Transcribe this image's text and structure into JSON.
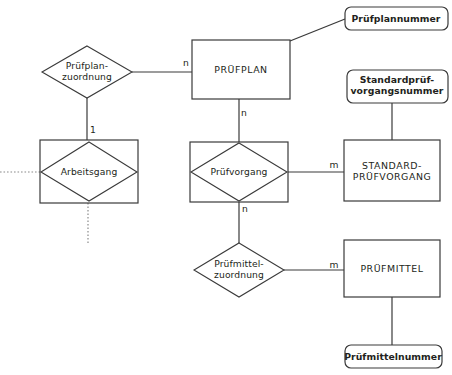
{
  "diagram": {
    "type": "entity-relationship-diagram",
    "language": "de",
    "colors": {
      "background": "#ffffff",
      "stroke": "#3a3a3a",
      "dotted_stroke": "#8a8a8a",
      "text": "#231f20"
    },
    "entities": [
      {
        "id": "pruefplan",
        "label": "PRÜFPLAN",
        "shape": "rectangle",
        "x": 192,
        "y": 40,
        "w": 98,
        "h": 59
      },
      {
        "id": "standard_pruefvorgang",
        "label": "STANDARD-\nPRÜFVORGANG",
        "shape": "rectangle",
        "x": 344,
        "y": 140,
        "w": 96,
        "h": 61
      },
      {
        "id": "pruefmittel",
        "label": "PRÜFMITTEL",
        "shape": "rectangle",
        "x": 344,
        "y": 240,
        "w": 96,
        "h": 57
      }
    ],
    "weak_entities": [
      {
        "id": "arbeitsgang",
        "label": "Arbeitsgang",
        "shape": "diamond-in-rectangle",
        "x": 40,
        "y": 140,
        "w": 98,
        "h": 63
      },
      {
        "id": "pruefvorgang",
        "label": "Prüfvorgang",
        "shape": "diamond-in-rectangle",
        "x": 190,
        "y": 142,
        "w": 98,
        "h": 60
      }
    ],
    "relationships": [
      {
        "id": "pruefplanzuordnung",
        "label": "Prüfplan-\nzuordnung",
        "shape": "diamond",
        "cx": 87,
        "cy": 72,
        "rx": 45,
        "ry": 26
      },
      {
        "id": "pruefmittelzuordnung",
        "label": "Prüfmittel-\nzuordnung",
        "shape": "diamond",
        "cx": 239,
        "cy": 270,
        "rx": 45,
        "ry": 27
      }
    ],
    "attributes": [
      {
        "id": "pruefplannummer",
        "label": "Prüfplannummer",
        "shape": "rounded-rectangle",
        "x": 345,
        "y": 7,
        "w": 103,
        "h": 23
      },
      {
        "id": "standardpruefvorgangsnummer",
        "label": "Standardprüf-\nvorgangsnummer",
        "shape": "rounded-rectangle",
        "x": 347,
        "y": 70,
        "w": 101,
        "h": 33
      },
      {
        "id": "pruefmittelnummer",
        "label": "Prüfmittelnummer",
        "shape": "rounded-rectangle",
        "x": 345,
        "y": 345,
        "w": 97,
        "h": 23
      }
    ],
    "cardinalities": [
      {
        "id": "card-pruefplan-left",
        "label": "n",
        "x": 186,
        "y": 63
      },
      {
        "id": "card-pruefplan-bottom",
        "label": "n",
        "x": 244,
        "y": 113
      },
      {
        "id": "card-arbeitsgang-top",
        "label": "1",
        "x": 93,
        "y": 130
      },
      {
        "id": "card-standard-left",
        "label": "m",
        "x": 334,
        "y": 165
      },
      {
        "id": "card-pruefvorgang-bottom",
        "label": "n",
        "x": 245,
        "y": 209
      },
      {
        "id": "card-pruefmittel-left",
        "label": "m",
        "x": 334,
        "y": 265
      }
    ],
    "connections": [
      {
        "id": "conn-pruefplan-nummer",
        "from": "pruefplan",
        "to": "pruefplannummer",
        "style": "solid"
      },
      {
        "id": "conn-zuordnung-pruefplan",
        "from": "pruefplanzuordnung",
        "to": "pruefplan",
        "style": "solid"
      },
      {
        "id": "conn-zuordnung-arbeitsgang",
        "from": "pruefplanzuordnung",
        "to": "arbeitsgang",
        "style": "solid"
      },
      {
        "id": "conn-pruefplan-pruefvorgang",
        "from": "pruefplan",
        "to": "pruefvorgang",
        "style": "solid"
      },
      {
        "id": "conn-pruefvorgang-standard",
        "from": "pruefvorgang",
        "to": "standard_pruefvorgang",
        "style": "solid"
      },
      {
        "id": "conn-standard-nummer",
        "from": "standardpruefvorgangsnummer",
        "to": "standard_pruefvorgang",
        "style": "solid"
      },
      {
        "id": "conn-pruefvorgang-mittelzu",
        "from": "pruefvorgang",
        "to": "pruefmittelzuordnung",
        "style": "solid"
      },
      {
        "id": "conn-mittelzu-pruefmittel",
        "from": "pruefmittelzuordnung",
        "to": "pruefmittel",
        "style": "solid"
      },
      {
        "id": "conn-pruefmittel-nummer",
        "from": "pruefmittel",
        "to": "pruefmittelnummer",
        "style": "solid"
      },
      {
        "id": "conn-arbeitsgang-left",
        "from": "arbeitsgang",
        "to": "external-left",
        "style": "dotted"
      },
      {
        "id": "conn-arbeitsgang-bottom",
        "from": "arbeitsgang",
        "to": "external-bottom",
        "style": "dotted"
      }
    ]
  }
}
